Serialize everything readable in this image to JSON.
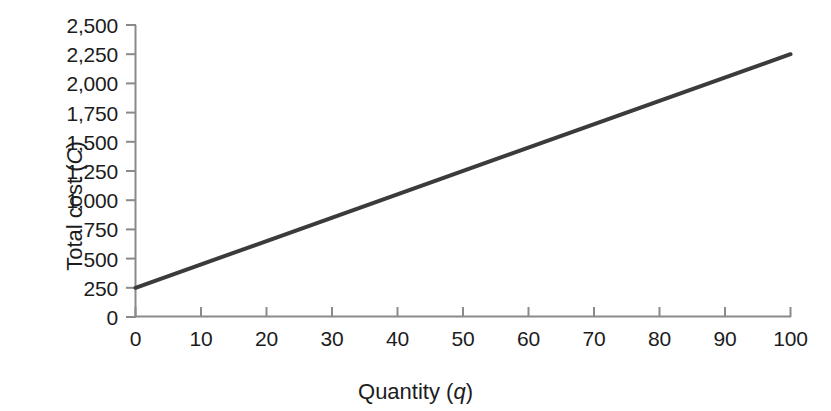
{
  "chart_data": {
    "type": "line",
    "title": "",
    "xlabel": "Quantity (q)",
    "ylabel": "Total cost (C)",
    "xlabel_text": "Quantity",
    "xlabel_var": "q",
    "ylabel_text": "Total cost",
    "ylabel_var": "C",
    "xlim": [
      0,
      100
    ],
    "ylim": [
      0,
      2500
    ],
    "grid": false,
    "legend": "none",
    "x_ticks": [
      0,
      10,
      20,
      30,
      40,
      50,
      60,
      70,
      80,
      90,
      100
    ],
    "x_tick_labels": [
      "0",
      "10",
      "20",
      "30",
      "40",
      "50",
      "60",
      "70",
      "80",
      "90",
      "100"
    ],
    "y_ticks": [
      0,
      250,
      500,
      750,
      1000,
      1250,
      1500,
      1750,
      2000,
      2250,
      2500
    ],
    "y_tick_labels": [
      "0",
      "250",
      "500",
      "750",
      "1,000",
      "1,250",
      "1,500",
      "1,750",
      "2,000",
      "2,250",
      "2,500"
    ],
    "series": [
      {
        "name": "Total cost",
        "equation": "C = 250 + 20q",
        "intercept": 250,
        "slope": 20,
        "color": "#3b3b3b",
        "line_width": 4,
        "x": [
          0,
          10,
          20,
          30,
          40,
          50,
          60,
          70,
          80,
          90,
          100
        ],
        "values": [
          250,
          450,
          650,
          850,
          1050,
          1250,
          1450,
          1650,
          1850,
          2050,
          2250
        ]
      }
    ],
    "axis_color": "#8a8a8a",
    "background": "#ffffff"
  }
}
